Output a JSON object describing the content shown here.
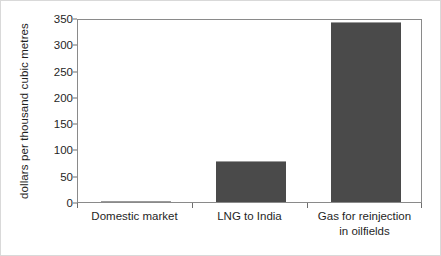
{
  "chart_data": {
    "type": "bar",
    "title": "",
    "subtitle": "",
    "xlabel": "",
    "ylabel": "dollars per thousand cubic metres",
    "categories": [
      "Domestic market",
      "LNG to India",
      "Gas for reinjection in oilfields"
    ],
    "category_lines": [
      [
        "Domestic market"
      ],
      [
        "LNG to India"
      ],
      [
        "Gas for reinjection",
        "in oilfields"
      ]
    ],
    "values": [
      2,
      78,
      342
    ],
    "ylim": [
      0,
      350
    ],
    "yticks": [
      0,
      50,
      100,
      150,
      200,
      250,
      300,
      350
    ],
    "ytick_labels": [
      "0",
      "50",
      "100",
      "150",
      "200",
      "250",
      "300",
      "350"
    ],
    "grid": false,
    "legend": null,
    "legend_position": "none",
    "bar_color": "#4a4a4a",
    "axis_color": "#8a8a8a",
    "background_color": "#ffffff",
    "frame_color": "#d9d9d9"
  }
}
